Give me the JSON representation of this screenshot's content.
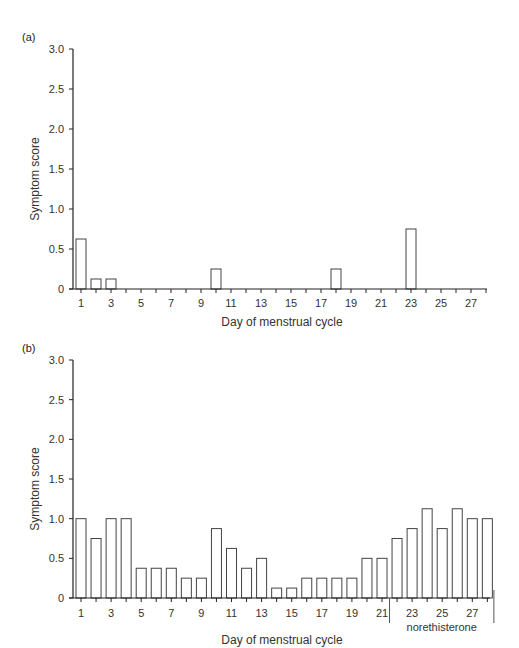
{
  "chart_data": [
    {
      "panel": "(a)",
      "type": "bar",
      "title": "",
      "xlabel": "Day of menstrual cycle",
      "ylabel": "Symptom score",
      "ylim": [
        0,
        3.0
      ],
      "yticks": [
        "0",
        "0.5",
        "1.0",
        "1.5",
        "2.0",
        "2.5",
        "3.0"
      ],
      "xtick_labels": [
        "1",
        "3",
        "5",
        "7",
        "9",
        "11",
        "13",
        "15",
        "17",
        "19",
        "21",
        "23",
        "25",
        "27"
      ],
      "grid": false,
      "legend": null,
      "categories": [
        1,
        2,
        3,
        4,
        5,
        6,
        7,
        8,
        9,
        10,
        11,
        12,
        13,
        14,
        15,
        16,
        17,
        18,
        19,
        20,
        21,
        22,
        23,
        24,
        25,
        26,
        27,
        28
      ],
      "values": [
        0.625,
        0.125,
        0.125,
        0,
        0,
        0,
        0,
        0,
        0,
        0.25,
        0,
        0,
        0,
        0,
        0,
        0,
        0,
        0.25,
        0,
        0,
        0,
        0,
        0.75,
        0,
        0,
        0,
        0,
        0
      ]
    },
    {
      "panel": "(b)",
      "type": "bar",
      "title": "",
      "xlabel": "Day of menstrual cycle",
      "ylabel": "Symptom score",
      "ylim": [
        0,
        3.0
      ],
      "yticks": [
        "0",
        "0.5",
        "1.0",
        "1.5",
        "2.0",
        "2.5",
        "3.0"
      ],
      "xtick_labels": [
        "1",
        "3",
        "5",
        "7",
        "9",
        "11",
        "13",
        "15",
        "17",
        "19",
        "21",
        "23",
        "25",
        "27"
      ],
      "grid": false,
      "legend": null,
      "annotations": [
        {
          "text": "norethisterone",
          "span_days": [
            22,
            28
          ]
        }
      ],
      "categories": [
        1,
        2,
        3,
        4,
        5,
        6,
        7,
        8,
        9,
        10,
        11,
        12,
        13,
        14,
        15,
        16,
        17,
        18,
        19,
        20,
        21,
        22,
        23,
        24,
        25,
        26,
        27,
        28
      ],
      "values": [
        1.0,
        0.75,
        1.0,
        1.0,
        0.375,
        0.375,
        0.375,
        0.25,
        0.25,
        0.875,
        0.625,
        0.375,
        0.5,
        0.125,
        0.125,
        0.25,
        0.25,
        0.25,
        0.25,
        0.5,
        0.5,
        0.75,
        0.875,
        1.125,
        0.875,
        1.125,
        1.0,
        1.0
      ]
    }
  ]
}
